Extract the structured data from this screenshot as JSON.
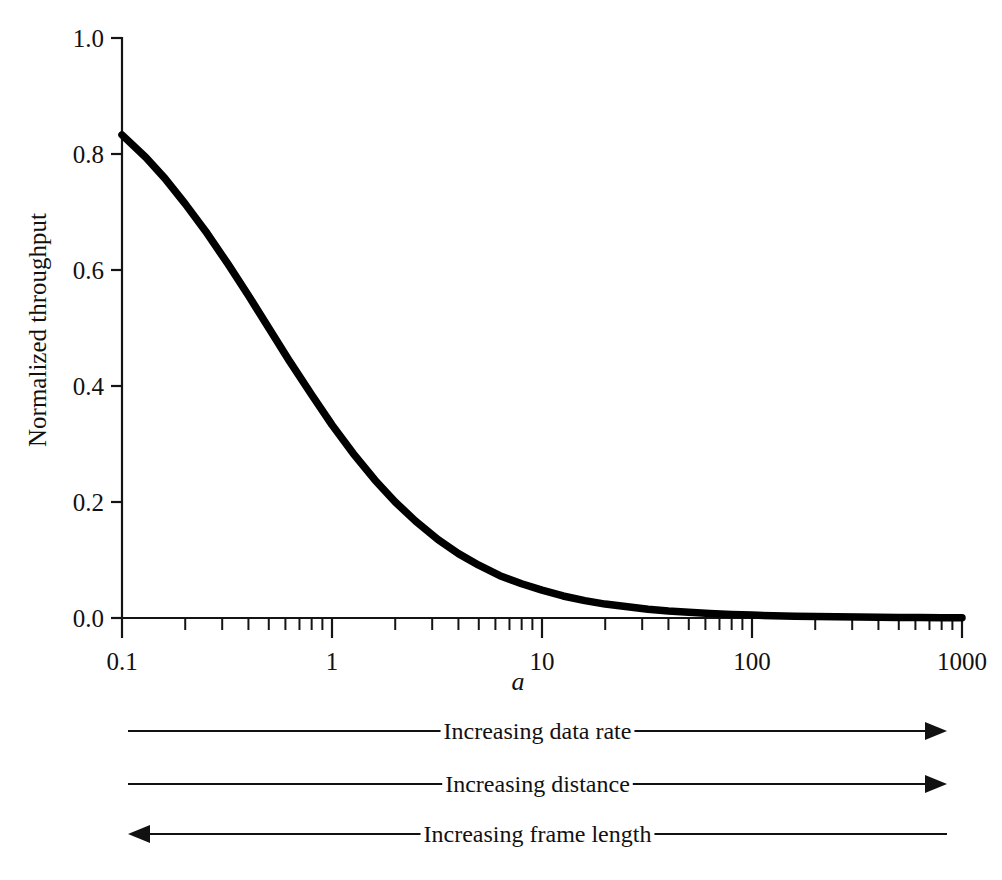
{
  "figure": {
    "name": "normalized-throughput-vs-a",
    "background": "#ffffff",
    "ink_color": "#000000"
  },
  "chart_data": {
    "type": "line",
    "title": "",
    "xlabel": "a",
    "ylabel": "Normalized throughput",
    "xscale": "log",
    "yscale": "linear",
    "xlim": [
      0.1,
      1000
    ],
    "ylim": [
      0.0,
      1.0
    ],
    "grid": false,
    "legend": null,
    "equation": "S = 1 / (1 + 2a)",
    "x_tick_labels": [
      "0.1",
      "1",
      "10",
      "100",
      "1000"
    ],
    "x_tick_values": [
      0.1,
      1,
      10,
      100,
      1000
    ],
    "x_minor_ticks": [
      0.2,
      0.3,
      0.4,
      0.5,
      0.6,
      0.7,
      0.8,
      0.9,
      2,
      3,
      4,
      5,
      6,
      7,
      8,
      9,
      20,
      30,
      40,
      50,
      60,
      70,
      80,
      90,
      200,
      300,
      400,
      500,
      600,
      700,
      800,
      900
    ],
    "y_tick_labels": [
      "0.0",
      "0.2",
      "0.4",
      "0.6",
      "0.8",
      "1.0"
    ],
    "y_tick_values": [
      0.0,
      0.2,
      0.4,
      0.6,
      0.8,
      1.0
    ],
    "series": [
      {
        "name": "Normalized throughput",
        "color": "#000000",
        "x": [
          0.1,
          0.13,
          0.16,
          0.2,
          0.25,
          0.32,
          0.4,
          0.5,
          0.63,
          0.8,
          1.0,
          1.26,
          1.6,
          2.0,
          2.5,
          3.2,
          4.0,
          5.0,
          6.3,
          8.0,
          10.0,
          12.6,
          16.0,
          20.0,
          25.0,
          32.0,
          40.0,
          50.0,
          63.0,
          80.0,
          100.0,
          126.0,
          160.0,
          200.0,
          250.0,
          320.0,
          400.0,
          500.0,
          630.0,
          800.0,
          1000.0
        ],
        "y": [
          0.833,
          0.794,
          0.758,
          0.714,
          0.667,
          0.61,
          0.556,
          0.5,
          0.442,
          0.385,
          0.333,
          0.284,
          0.238,
          0.2,
          0.167,
          0.135,
          0.111,
          0.091,
          0.073,
          0.059,
          0.048,
          0.038,
          0.03,
          0.024,
          0.02,
          0.015,
          0.012,
          0.0099,
          0.0079,
          0.0062,
          0.005,
          0.0039,
          0.0031,
          0.0025,
          0.002,
          0.0016,
          0.0012,
          0.001,
          0.0008,
          0.0006,
          0.0005
        ]
      }
    ],
    "annotations": [
      {
        "id": "increasing-data-rate",
        "label": "Increasing data rate",
        "direction": "right",
        "row": 1
      },
      {
        "id": "increasing-distance",
        "label": "Increasing distance",
        "direction": "right",
        "row": 2
      },
      {
        "id": "increasing-frame-length",
        "label": "Increasing frame length",
        "direction": "left",
        "row": 3
      }
    ]
  }
}
